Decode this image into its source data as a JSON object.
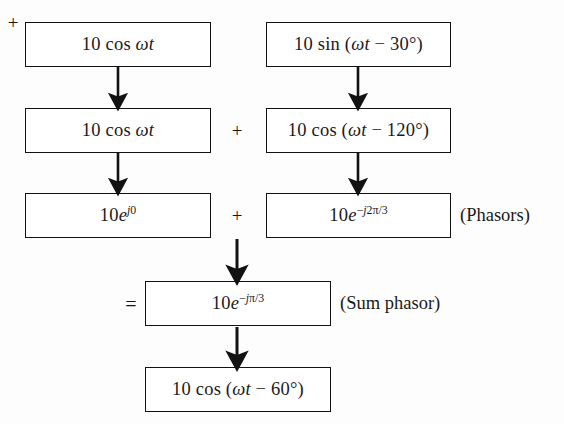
{
  "diagram": {
    "type": "flow-diagram",
    "background_color": "#fdfdfd",
    "line_color": "#121212",
    "text_color": "#1a1a1a",
    "rows": [
      {
        "id": "row-1",
        "left_box": "10 cos ωt",
        "operator": "+",
        "right_box": "10 sin (ωt − 30°)",
        "side_label": ""
      },
      {
        "id": "row-2",
        "left_box": "10 cos ωt",
        "operator": "+",
        "right_box": "10 cos (ωt − 120°)",
        "side_label": ""
      },
      {
        "id": "row-3",
        "left_box": "10e^{j0}",
        "operator": "+",
        "right_box": "10e^{−j2π/3}",
        "side_label": "(Phasors)"
      },
      {
        "id": "row-4",
        "operator": "=",
        "center_box": "10e^{−jπ/3}",
        "side_label": "(Sum phasor)"
      },
      {
        "id": "row-5",
        "center_box": "10 cos (ωt − 60°)",
        "side_label": ""
      }
    ],
    "boxes": {
      "cos_wt_1": {
        "num": "10",
        "fn": "cos",
        "arg": "ωt",
        "full": "10 cos ωt"
      },
      "sin_wt_30": {
        "num": "10",
        "fn": "sin",
        "open": "(",
        "arg": "ωt",
        "minus": "−",
        "angle": "30°",
        "close": ")",
        "full": "10 sin (ωt − 30°)"
      },
      "cos_wt_2": {
        "num": "10",
        "fn": "cos",
        "arg": "ωt",
        "full": "10 cos ωt"
      },
      "cos_wt_120": {
        "num": "10",
        "fn": "cos",
        "open": "(",
        "arg": "ωt",
        "minus": "−",
        "angle": "120°",
        "close": ")",
        "full": "10 cos (ωt − 120°)"
      },
      "phasor_left": {
        "mag": "10",
        "base": "e",
        "exponent": "j0",
        "full": "10e^{j0}"
      },
      "phasor_right": {
        "mag": "10",
        "base": "e",
        "exponent": "−j2π/3",
        "full": "10e^{−j2π/3}"
      },
      "phasor_sum": {
        "mag": "10",
        "base": "e",
        "exponent": "−jπ/3",
        "full": "10e^{−jπ/3}"
      },
      "cos_wt_60": {
        "num": "10",
        "fn": "cos",
        "open": "(",
        "arg": "ωt",
        "minus": "−",
        "angle": "60°",
        "close": ")",
        "full": "10 cos (ωt − 60°)"
      }
    },
    "operators": {
      "plus": "+",
      "equals": "="
    },
    "labels": {
      "phasors": "(Phasors)",
      "sum_phasor": "(Sum phasor)"
    },
    "arrows": [
      {
        "id": "arrow-left-1-2",
        "from": "cos_wt_1",
        "to": "cos_wt_2"
      },
      {
        "id": "arrow-right-1-2",
        "from": "sin_wt_30",
        "to": "cos_wt_120"
      },
      {
        "id": "arrow-left-2-3",
        "from": "cos_wt_2",
        "to": "phasor_left"
      },
      {
        "id": "arrow-right-2-3",
        "from": "cos_wt_120",
        "to": "phasor_right"
      },
      {
        "id": "arrow-merge-to-sum",
        "from": "phasor-row",
        "to": "phasor_sum"
      },
      {
        "id": "arrow-sum-to-time",
        "from": "phasor_sum",
        "to": "cos_wt_60"
      }
    ]
  }
}
